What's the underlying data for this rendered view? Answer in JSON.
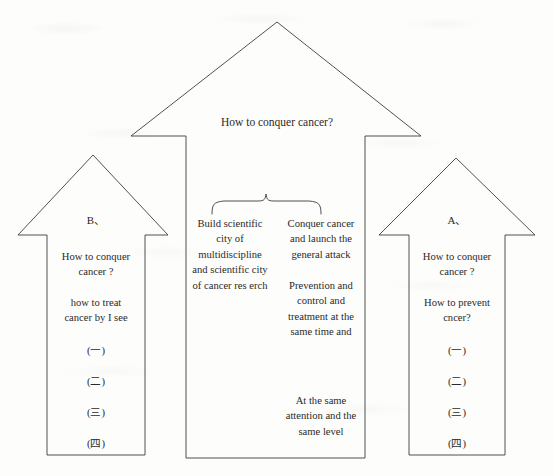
{
  "figure": {
    "type": "arrow-diagram",
    "background_color": "#fdfdfb",
    "stroke_color": "#3d3d3d",
    "text_color": "#2a2a2a",
    "top_arrow": {
      "name": "how-to-conquer-cancer",
      "label": "How to conquer cancer?"
    },
    "brace": {
      "name": "grouping-brace",
      "label": ""
    },
    "left_arrow": {
      "name": "arrow-b",
      "letter": "B、",
      "blocks": [
        "How to conquer\ncancer ?",
        "how to treat\ncancer by I see"
      ],
      "enumerations": [
        "(一)",
        "(二)",
        "(三)",
        "(四)"
      ]
    },
    "right_arrow": {
      "name": "arrow-a",
      "letter": "A、",
      "blocks": [
        "How to conquer\ncancer ?",
        "How to prevent\ncncer?"
      ],
      "enumerations": [
        "(一)",
        "(二)",
        "(三)",
        "(四)"
      ]
    },
    "center_shaft": {
      "name": "center-column",
      "left_column": [
        "Build scientific\ncity of\nmultidiscipline\nand scientific city\nof cancer res erch"
      ],
      "right_column": [
        "Conquer cancer\nand launch the\ngeneral attack",
        "Prevention and\ncontrol and\ntreatment at the\nsame time and",
        "At the  same\nattention and the\nsame level"
      ]
    }
  }
}
